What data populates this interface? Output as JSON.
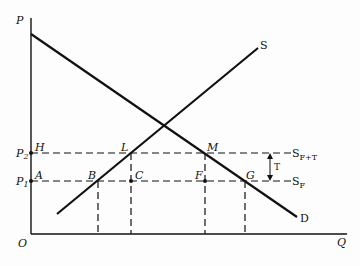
{
  "diagram": {
    "type": "supply-demand-tariff",
    "axes": {
      "y_label": "P",
      "x_label": "Q",
      "origin_label": "O"
    },
    "price_levels": [
      {
        "label": "P",
        "sub": "2",
        "point": "H"
      },
      {
        "label": "P",
        "sub": "1",
        "point": "A"
      }
    ],
    "curves": [
      {
        "label": "S",
        "type": "supply"
      },
      {
        "label": "D",
        "type": "demand"
      }
    ],
    "horizontal_supply_lines": [
      {
        "label": "S",
        "sub": "F+T"
      },
      {
        "label": "S",
        "sub": "F"
      }
    ],
    "tariff_label": "T",
    "points": [
      "H",
      "L",
      "M",
      "A",
      "B",
      "C",
      "F",
      "G"
    ]
  }
}
